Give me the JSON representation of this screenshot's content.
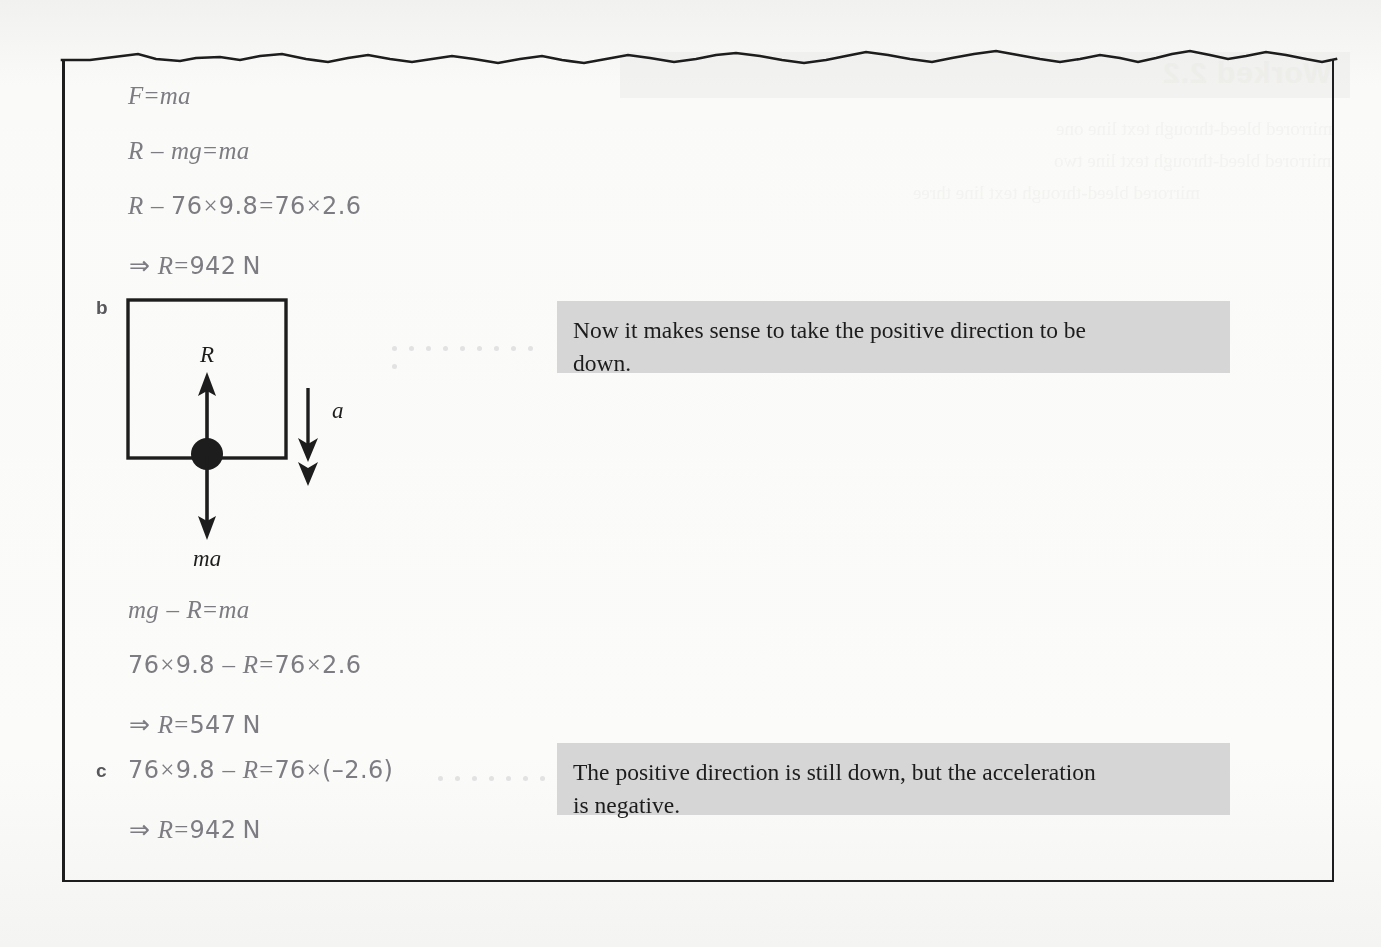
{
  "page": {
    "background_color": "#f7f7f5",
    "frame_color": "#1d1d1d",
    "equation_color": "#7c7c82",
    "callout_background": "#d6d6d6",
    "callout_text_color": "#1c1c1c"
  },
  "ghost_showthrough": {
    "title": "Worked 2.2",
    "line1": "mirrored bleed-through text line one",
    "line2": "mirrored bleed-through text line two",
    "line3": "mirrored bleed-through text line three"
  },
  "part_labels": {
    "b": "b",
    "c": "c"
  },
  "equations": [
    {
      "id": "eq1",
      "text": "F = ma",
      "x": 128,
      "y": 82
    },
    {
      "id": "eq2",
      "text": "R − mg = ma",
      "x": 128,
      "y": 137
    },
    {
      "id": "eq3",
      "text": "R − 76 × 9.8 = 76 × 2.6",
      "x": 128,
      "y": 192
    },
    {
      "id": "eq4",
      "text": "⇒ R = 942 N",
      "x": 128,
      "y": 251
    },
    {
      "id": "eq5",
      "text": "mg − R = ma",
      "x": 128,
      "y": 596
    },
    {
      "id": "eq6",
      "text": "76 × 9.8 − R = 76 × 2.6",
      "x": 128,
      "y": 651
    },
    {
      "id": "eq7",
      "text": "⇒ R = 547 N",
      "x": 128,
      "y": 710
    },
    {
      "id": "eq8",
      "text": "76 × 9.8 − R = 76 × (−2.6)",
      "x": 128,
      "y": 756
    },
    {
      "id": "eq9",
      "text": "⇒ R = 942 N",
      "x": 128,
      "y": 815
    }
  ],
  "diagram": {
    "label_R": "R",
    "label_mg": "mg",
    "label_a": "a"
  },
  "callouts": [
    {
      "id": "callout-b",
      "line1": "Now it makes sense to take the positive direction to be",
      "line2": "down."
    },
    {
      "id": "callout-c",
      "line1": "The positive direction is still down, but the acceleration",
      "line2": "is negative."
    }
  ]
}
